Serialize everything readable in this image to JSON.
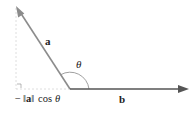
{
  "diagram": {
    "vectors": [
      {
        "name": "a",
        "from": [
          70,
          89
        ],
        "to": [
          16,
          6
        ],
        "color": "#8c8c8c"
      },
      {
        "name": "b",
        "from": [
          70,
          89
        ],
        "to": [
          188,
          89
        ],
        "color": "#555555"
      }
    ],
    "labels": {
      "a": "a",
      "b": "b",
      "theta": "θ",
      "projection": "−‖a‖ cos θ",
      "projection_minus": "−",
      "projection_norm_open": "‖",
      "projection_norm_a": "a",
      "projection_norm_close": "‖",
      "projection_cos": "cos",
      "projection_theta": "θ"
    },
    "colors": {
      "vector_a": "#8c8c8c",
      "vector_b": "#555555",
      "guide": "#cccccc",
      "text": "#222222"
    }
  }
}
